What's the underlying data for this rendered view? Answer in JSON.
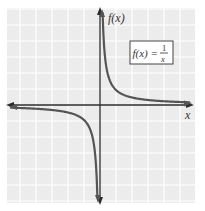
{
  "chart_data": {
    "type": "line",
    "title": "",
    "xlabel": "x",
    "ylabel": "f(x)",
    "legend": [],
    "annotations": [
      "f(x) = 1/x"
    ],
    "grid": true,
    "xlim": [
      -6,
      6
    ],
    "ylim": [
      -6,
      6
    ],
    "series": [
      {
        "name": "f(x) = 1/x",
        "branch": "positive",
        "x": [
          0.167,
          0.2,
          0.25,
          0.333,
          0.5,
          1,
          1.5,
          2,
          3,
          4,
          5,
          6
        ],
        "y": [
          6,
          5,
          4,
          3,
          2,
          1,
          0.667,
          0.5,
          0.333,
          0.25,
          0.2,
          0.167
        ]
      },
      {
        "name": "f(x) = 1/x",
        "branch": "negative",
        "x": [
          -6,
          -5,
          -4,
          -3,
          -2,
          -1.5,
          -1,
          -0.5,
          -0.333,
          -0.25,
          -0.2,
          -0.167
        ],
        "y": [
          -0.167,
          -0.2,
          -0.25,
          -0.333,
          -0.5,
          -0.667,
          -1,
          -2,
          -3,
          -4,
          -5,
          -6
        ]
      }
    ]
  },
  "labels": {
    "y_axis": "f(x)",
    "x_axis": "x",
    "formula_lhs": "f(x) =",
    "formula_num": "1",
    "formula_den": "x"
  },
  "colors": {
    "background_grid": "#ececec",
    "gridlines": "#ffffff",
    "axes": "#2b2b2b",
    "curve": "#555555",
    "box_border": "#444444"
  }
}
